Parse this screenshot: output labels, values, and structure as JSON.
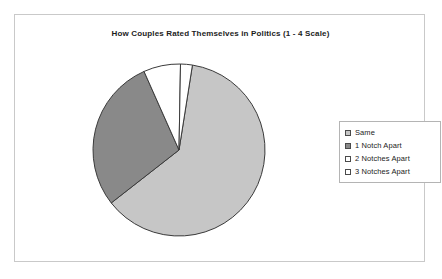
{
  "chart_frame": {
    "border_color": "#c9c9c9",
    "background": "#ffffff"
  },
  "title": "How Couples Rated Themselves in Politics (1 - 4 Scale)",
  "legend": {
    "position": "right",
    "entries": [
      {
        "label": "Same",
        "color": "#c6c6c6"
      },
      {
        "label": "1 Notch Apart",
        "color": "#898989"
      },
      {
        "label": "2 Notches Apart",
        "color": "#ffffff"
      },
      {
        "label": "3 Notches Apart",
        "color": "#ffffff"
      }
    ]
  },
  "chart_data": {
    "type": "pie",
    "title": "How Couples Rated Themselves in Politics (1 - 4 Scale)",
    "xlabel": "",
    "ylabel": "",
    "legend_position": "right",
    "grid": false,
    "start_angle_deg": 0,
    "direction": "clockwise",
    "categories": [
      "Same",
      "1 Notch Apart",
      "2 Notches Apart",
      "3 Notches Apart"
    ],
    "values": [
      62,
      29,
      7,
      2
    ],
    "units": "percent",
    "slices": [
      {
        "label": "Same",
        "value": 62,
        "color": "#c6c6c6",
        "start_deg": 9,
        "end_deg": 232
      },
      {
        "label": "1 Notch Apart",
        "value": 29,
        "color": "#898989",
        "start_deg": 232,
        "end_deg": 336
      },
      {
        "label": "2 Notches Apart",
        "value": 7,
        "color": "#ffffff",
        "start_deg": 336,
        "end_deg": 361
      },
      {
        "label": "3 Notches Apart",
        "value": 2,
        "color": "#ffffff",
        "start_deg": 361,
        "end_deg": 369
      }
    ],
    "slice_outline_color": "#3a3a3a",
    "center": {
      "x": 87,
      "y": 87
    },
    "radius": 86
  }
}
